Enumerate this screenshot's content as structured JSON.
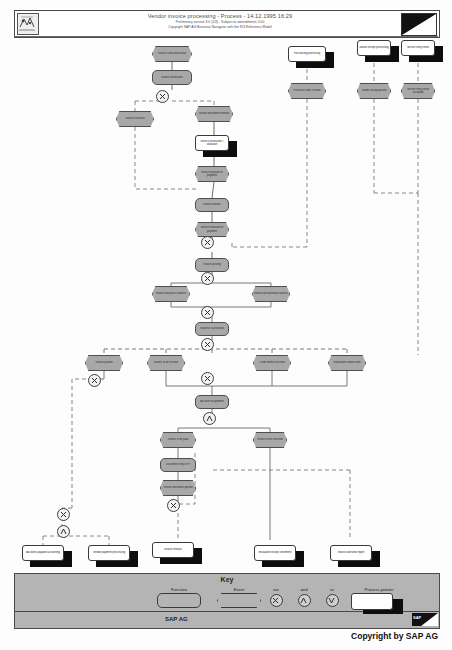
{
  "document": {
    "title": "Vendor invoice processing - Process - 14.12.1995 16:29",
    "subtitle1": "Preliminary version 3.0 (1/3) - Subject to amendments 3.00",
    "subtitle2": "Copyright SAP AG Business Navigator with the R/3 Reference Model",
    "copyright": "Copyright by SAP AG",
    "footer_company": "SAP AG",
    "logo_alt": "sap-navigator-logo"
  },
  "key": {
    "title": "Key",
    "function_label": "Function",
    "event_label": "Event",
    "xor_label": "xor",
    "and_label": "and",
    "or_label": "or",
    "process_pointer_label": "Process pointer"
  },
  "colors": {
    "node_fill": "#a8a8a8",
    "node_border": "#4f4f4f",
    "key_fill": "#b4b4b4",
    "shadow": "#0d0d0d",
    "page": "#fdfdfd"
  },
  "nodes": [
    {
      "id": "ev_start",
      "type": "event",
      "label": "Invoice to be processed",
      "x": 152,
      "y": 46,
      "w": 40,
      "h": 16
    },
    {
      "id": "fn_invoice",
      "type": "function",
      "label": "Invoice verification",
      "x": 152,
      "y": 70,
      "w": 40,
      "h": 15
    },
    {
      "id": "pp_purch",
      "type": "process-pointer",
      "label": "Purchasing processing",
      "x": 288,
      "y": 46,
      "w": 38,
      "h": 16
    },
    {
      "id": "ev_purch",
      "type": "event",
      "label": "Purchase order created",
      "x": 288,
      "y": 83,
      "w": 38,
      "h": 16
    },
    {
      "id": "pp_goods",
      "type": "process-pointer",
      "label": "Goods receipt processing",
      "x": 357,
      "y": 40,
      "w": 34,
      "h": 16
    },
    {
      "id": "ev_goods",
      "type": "event",
      "label": "Goods receipt posted",
      "x": 357,
      "y": 83,
      "w": 34,
      "h": 16
    },
    {
      "id": "pp_service",
      "type": "process-pointer",
      "label": "Service entry sheet",
      "x": 401,
      "y": 40,
      "w": 34,
      "h": 16
    },
    {
      "id": "ev_service",
      "type": "event",
      "label": "Service entry sheet accepted",
      "x": 401,
      "y": 83,
      "w": 34,
      "h": 16
    },
    {
      "id": "ev_left1",
      "type": "event",
      "label": "Invoice received",
      "x": 116,
      "y": 111,
      "w": 38,
      "h": 16
    },
    {
      "id": "ev_mid1",
      "type": "event",
      "label": "Invoice document entered",
      "x": 195,
      "y": 106,
      "w": 38,
      "h": 16
    },
    {
      "id": "fn_verify",
      "type": "process-pointer",
      "label": "Invoice verification / valuation",
      "x": 195,
      "y": 135,
      "w": 34,
      "h": 16
    },
    {
      "id": "ev_blocked",
      "type": "event",
      "label": "Invoice blocked for payment",
      "x": 195,
      "y": 166,
      "w": 34,
      "h": 16
    },
    {
      "id": "fn_check1",
      "type": "function",
      "label": "Invoice release",
      "x": 195,
      "y": 198,
      "w": 34,
      "h": 14
    },
    {
      "id": "ev_released",
      "type": "event",
      "label": "Invoice released for payment",
      "x": 195,
      "y": 222,
      "w": 34,
      "h": 15
    },
    {
      "id": "fn_post",
      "type": "function",
      "label": "Invoice posting",
      "x": 195,
      "y": 258,
      "w": 34,
      "h": 14
    },
    {
      "id": "ev_br_left",
      "type": "event",
      "label": "Invoice with price variance",
      "x": 152,
      "y": 286,
      "w": 38,
      "h": 16
    },
    {
      "id": "ev_br_right",
      "type": "event",
      "label": "Invoice with quantity variance",
      "x": 252,
      "y": 286,
      "w": 38,
      "h": 16
    },
    {
      "id": "fn_mid2",
      "type": "function",
      "label": "Variance clarification",
      "x": 195,
      "y": 322,
      "w": 34,
      "h": 14
    },
    {
      "id": "ev_row_a",
      "type": "event",
      "label": "Invoice parked",
      "x": 85,
      "y": 355,
      "w": 38,
      "h": 16
    },
    {
      "id": "ev_row_b",
      "type": "event",
      "label": "Invoice to be verified",
      "x": 147,
      "y": 355,
      "w": 38,
      "h": 16
    },
    {
      "id": "ev_row_c",
      "type": "event",
      "label": "Credit memo received",
      "x": 253,
      "y": 355,
      "w": 38,
      "h": 16
    },
    {
      "id": "ev_row_d",
      "type": "event",
      "label": "Subsequent debit/credit",
      "x": 328,
      "y": 355,
      "w": 38,
      "h": 16
    },
    {
      "id": "fn_lower1",
      "type": "function",
      "label": "Account assignment",
      "x": 195,
      "y": 395,
      "w": 34,
      "h": 14
    },
    {
      "id": "ev_low_a",
      "type": "event",
      "label": "Invoice to be paid",
      "x": 160,
      "y": 432,
      "w": 36,
      "h": 16
    },
    {
      "id": "ev_low_r",
      "type": "event",
      "label": "Invoice to be reversed",
      "x": 253,
      "y": 432,
      "w": 34,
      "h": 16
    },
    {
      "id": "fn_low_b",
      "type": "function",
      "label": "Document entry in FI",
      "x": 160,
      "y": 458,
      "w": 36,
      "h": 14
    },
    {
      "id": "ev_low_c",
      "type": "event",
      "label": "Invoice document posted",
      "x": 160,
      "y": 480,
      "w": 36,
      "h": 16
    },
    {
      "id": "pp_bot1",
      "type": "process-pointer",
      "label": "Accounts payable accounting",
      "x": 22,
      "y": 545,
      "w": 42,
      "h": 16
    },
    {
      "id": "pp_bot2",
      "type": "process-pointer",
      "label": "Vendor payment processing",
      "x": 88,
      "y": 545,
      "w": 42,
      "h": 16
    },
    {
      "id": "pp_bot3",
      "type": "process-pointer",
      "label": "Invoice release",
      "x": 152,
      "y": 542,
      "w": 42,
      "h": 16
    },
    {
      "id": "pp_bot4",
      "type": "process-pointer",
      "label": "Evaluated receipt settlement",
      "x": 254,
      "y": 545,
      "w": 42,
      "h": 16
    },
    {
      "id": "pp_bot5",
      "type": "process-pointer",
      "label": "Invoice overview report",
      "x": 330,
      "y": 545,
      "w": 42,
      "h": 16
    }
  ],
  "connectors": [
    {
      "id": "c1",
      "op": "xor",
      "x": 161,
      "y": 95
    },
    {
      "id": "c2",
      "op": "xor",
      "x": 206,
      "y": 241
    },
    {
      "id": "c3",
      "op": "xor",
      "x": 206,
      "y": 277
    },
    {
      "id": "c4",
      "op": "xor",
      "x": 206,
      "y": 311
    },
    {
      "id": "c5",
      "op": "xor",
      "x": 206,
      "y": 343
    },
    {
      "id": "c6",
      "op": "xor",
      "x": 206,
      "y": 377
    },
    {
      "id": "c7",
      "op": "and",
      "x": 208,
      "y": 417
    },
    {
      "id": "c8",
      "op": "xor",
      "x": 93,
      "y": 379
    },
    {
      "id": "c9",
      "op": "xor",
      "x": 172,
      "y": 504
    },
    {
      "id": "c10",
      "op": "xor",
      "x": 62,
      "y": 513
    },
    {
      "id": "c11",
      "op": "and",
      "x": 62,
      "y": 530
    }
  ]
}
